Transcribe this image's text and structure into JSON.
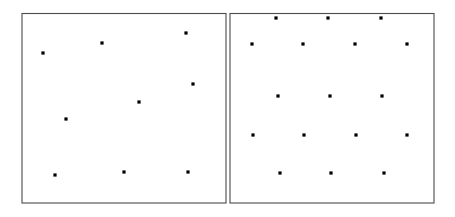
{
  "figure": {
    "background_color": "#ffffff",
    "border_color": "#4a4a4a",
    "edge_color": "#555555",
    "seed_color": "#000000",
    "seed_marker": "square-dot",
    "seed_size": 3.2,
    "border_width": 1.1,
    "edge_width": 0.9
  },
  "panels": [
    {
      "name": "irregular-voronoi-panel",
      "label": "Irregular Voronoi diagram",
      "frame": {
        "x": 22,
        "y": 13.5,
        "width": 204,
        "height": 189.5
      },
      "seed_count": 9,
      "seeds": [
        {
          "id": "L1",
          "x": 43,
          "y": 53
        },
        {
          "id": "L2",
          "x": 102,
          "y": 43
        },
        {
          "id": "L3",
          "x": 186,
          "y": 33
        },
        {
          "id": "L4",
          "x": 66,
          "y": 119
        },
        {
          "id": "L5",
          "x": 139,
          "y": 102
        },
        {
          "id": "L6",
          "x": 193,
          "y": 84
        },
        {
          "id": "L7",
          "x": 55,
          "y": 175
        },
        {
          "id": "L8",
          "x": 124,
          "y": 172
        },
        {
          "id": "L9",
          "x": 188,
          "y": 172
        }
      ],
      "edges": [
        {
          "id": "e1",
          "points": "72,13.5 84,86 116,126"
        },
        {
          "id": "e2",
          "points": "22,86 84,86"
        },
        {
          "id": "e3",
          "points": "84,86 150,75"
        },
        {
          "id": "e4",
          "points": "150,75 226,63"
        },
        {
          "id": "e5",
          "points": "150,75 139,13.5"
        },
        {
          "id": "e6",
          "points": "150,75 160,128"
        },
        {
          "id": "e7",
          "points": "116,126 160,128"
        },
        {
          "id": "e8",
          "points": "116,126 96,203"
        },
        {
          "id": "e9",
          "points": "22,133 92,134 116,126"
        },
        {
          "id": "e10",
          "points": "160,128 226,133"
        },
        {
          "id": "e11",
          "points": "160,128 156,203"
        }
      ]
    },
    {
      "name": "hexagonal-voronoi-panel",
      "label": "Centroidal hexagonal Voronoi tessellation",
      "frame": {
        "x": 230,
        "y": 13.5,
        "width": 204,
        "height": 189.5
      },
      "seed_count": 24,
      "lattice": {
        "type": "hexagonal",
        "column_spacing": 51.5,
        "row_spacing": 38.5,
        "hex_circumradius": 25.5,
        "orientation": "pointy-side-horizontal"
      },
      "rows": [
        {
          "row": 0,
          "y": 18,
          "count": 3,
          "xs": [
            276,
            328,
            381
          ]
        },
        {
          "row": 1,
          "y": 44,
          "count": 4,
          "xs": [
            252,
            303,
            355,
            407
          ]
        },
        {
          "row": 2,
          "y": 96,
          "count": 3,
          "xs": [
            278,
            330,
            382
          ]
        },
        {
          "row": 3,
          "y": 135,
          "count": 4,
          "xs": [
            253,
            304,
            356,
            407
          ]
        },
        {
          "row": 4,
          "y": 173,
          "count": 3,
          "xs": [
            280,
            331,
            384
          ]
        }
      ],
      "seeds": [
        {
          "id": "R1",
          "x": 276,
          "y": 18
        },
        {
          "id": "R2",
          "x": 328,
          "y": 18
        },
        {
          "id": "R3",
          "x": 381,
          "y": 18
        },
        {
          "id": "R4",
          "x": 252,
          "y": 44
        },
        {
          "id": "R5",
          "x": 303,
          "y": 44
        },
        {
          "id": "R6",
          "x": 355,
          "y": 44
        },
        {
          "id": "R7",
          "x": 407,
          "y": 44
        },
        {
          "id": "R8",
          "x": 278,
          "y": 96
        },
        {
          "id": "R9",
          "x": 330,
          "y": 96
        },
        {
          "id": "R10",
          "x": 382,
          "y": 96
        },
        {
          "id": "R11",
          "x": 253,
          "y": 135
        },
        {
          "id": "R12",
          "x": 304,
          "y": 135
        },
        {
          "id": "R13",
          "x": 356,
          "y": 135
        },
        {
          "id": "R14",
          "x": 407,
          "y": 135
        },
        {
          "id": "R15",
          "x": 280,
          "y": 173
        },
        {
          "id": "R16",
          "x": 331,
          "y": 173
        },
        {
          "id": "R17",
          "x": 384,
          "y": 173
        }
      ],
      "hex_cells": [
        {
          "id": "h-r1-c1",
          "cx": 252,
          "cy": 44
        },
        {
          "id": "h-r1-c2",
          "cx": 303,
          "cy": 44
        },
        {
          "id": "h-r1-c3",
          "cx": 355,
          "cy": 44
        },
        {
          "id": "h-r1-c4",
          "cx": 407,
          "cy": 44
        },
        {
          "id": "h-r2-c1",
          "cx": 278,
          "cy": 83
        },
        {
          "id": "h-r2-c2",
          "cx": 330,
          "cy": 83
        },
        {
          "id": "h-r2-c3",
          "cx": 382,
          "cy": 83
        },
        {
          "id": "h-r3-c1",
          "cx": 253,
          "cy": 122
        },
        {
          "id": "h-r3-c2",
          "cx": 304,
          "cy": 122
        },
        {
          "id": "h-r3-c3",
          "cx": 356,
          "cy": 122
        },
        {
          "id": "h-r3-c4",
          "cx": 407,
          "cy": 122
        },
        {
          "id": "h-r4-c1",
          "cx": 280,
          "cy": 161
        },
        {
          "id": "h-r4-c2",
          "cx": 331,
          "cy": 161
        },
        {
          "id": "h-r4-c3",
          "cx": 384,
          "cy": 161
        },
        {
          "id": "h-r0-c1",
          "cx": 276,
          "cy": 5
        },
        {
          "id": "h-r0-c2",
          "cx": 328,
          "cy": 5
        },
        {
          "id": "h-r0-c3",
          "cx": 381,
          "cy": 5
        },
        {
          "id": "h-r5-c1",
          "cx": 253,
          "cy": 200
        },
        {
          "id": "h-r5-c2",
          "cx": 304,
          "cy": 200
        },
        {
          "id": "h-r5-c3",
          "cx": 356,
          "cy": 200
        },
        {
          "id": "h-r5-c4",
          "cx": 407,
          "cy": 200
        }
      ]
    }
  ]
}
